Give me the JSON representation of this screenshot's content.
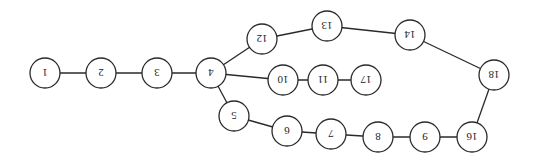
{
  "diagram": {
    "type": "graph",
    "label_orientation": "rotated-180",
    "colors": {
      "stroke": "#2a2a2a",
      "fill": "#ffffff",
      "text": "#222222"
    },
    "node_radius": 15,
    "nodes": [
      {
        "id": "1",
        "label": "1",
        "x": 45,
        "y": 73
      },
      {
        "id": "2",
        "label": "2",
        "x": 101,
        "y": 73
      },
      {
        "id": "3",
        "label": "3",
        "x": 157,
        "y": 73
      },
      {
        "id": "4",
        "label": "4",
        "x": 211,
        "y": 73
      },
      {
        "id": "12",
        "label": "12",
        "x": 262,
        "y": 39
      },
      {
        "id": "13",
        "label": "13",
        "x": 327,
        "y": 26
      },
      {
        "id": "14",
        "label": "14",
        "x": 410,
        "y": 35
      },
      {
        "id": "18",
        "label": "18",
        "x": 494,
        "y": 75
      },
      {
        "id": "10",
        "label": "10",
        "x": 283,
        "y": 80
      },
      {
        "id": "11",
        "label": "11",
        "x": 323,
        "y": 80
      },
      {
        "id": "17",
        "label": "17",
        "x": 366,
        "y": 80
      },
      {
        "id": "5",
        "label": "5",
        "x": 234,
        "y": 116
      },
      {
        "id": "6",
        "label": "6",
        "x": 287,
        "y": 131
      },
      {
        "id": "7",
        "label": "7",
        "x": 331,
        "y": 134
      },
      {
        "id": "8",
        "label": "8",
        "x": 378,
        "y": 137
      },
      {
        "id": "9",
        "label": "9",
        "x": 425,
        "y": 137
      },
      {
        "id": "16",
        "label": "16",
        "x": 472,
        "y": 137
      }
    ],
    "edges": [
      [
        "1",
        "2"
      ],
      [
        "2",
        "3"
      ],
      [
        "3",
        "4"
      ],
      [
        "4",
        "12"
      ],
      [
        "12",
        "13"
      ],
      [
        "13",
        "14"
      ],
      [
        "14",
        "18"
      ],
      [
        "4",
        "10"
      ],
      [
        "10",
        "11"
      ],
      [
        "11",
        "17"
      ],
      [
        "4",
        "5"
      ],
      [
        "5",
        "6"
      ],
      [
        "6",
        "7"
      ],
      [
        "7",
        "8"
      ],
      [
        "8",
        "9"
      ],
      [
        "9",
        "16"
      ],
      [
        "16",
        "18"
      ]
    ]
  }
}
